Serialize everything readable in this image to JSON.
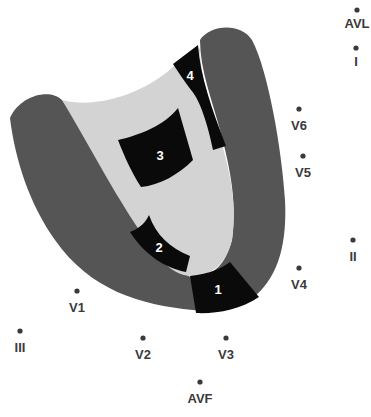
{
  "diagram": {
    "colors": {
      "wall": "#555555",
      "cavity": "#d3d3d3",
      "segment": "#0a0a0a",
      "lead_dot": "#3a3a3a",
      "lead_text": "#3a3a3a",
      "segment_text": "#ffffff"
    },
    "segments": [
      {
        "id": "1",
        "label": "1"
      },
      {
        "id": "2",
        "label": "2"
      },
      {
        "id": "3",
        "label": "3"
      },
      {
        "id": "4",
        "label": "4"
      }
    ],
    "leads": [
      {
        "id": "avl",
        "label": "AVL"
      },
      {
        "id": "i",
        "label": "I"
      },
      {
        "id": "v6",
        "label": "V6"
      },
      {
        "id": "v5",
        "label": "V5"
      },
      {
        "id": "ii",
        "label": "II"
      },
      {
        "id": "v4",
        "label": "V4"
      },
      {
        "id": "v1",
        "label": "V1"
      },
      {
        "id": "iii",
        "label": "III"
      },
      {
        "id": "v2",
        "label": "V2"
      },
      {
        "id": "v3",
        "label": "V3"
      },
      {
        "id": "avf",
        "label": "AVF"
      }
    ]
  }
}
